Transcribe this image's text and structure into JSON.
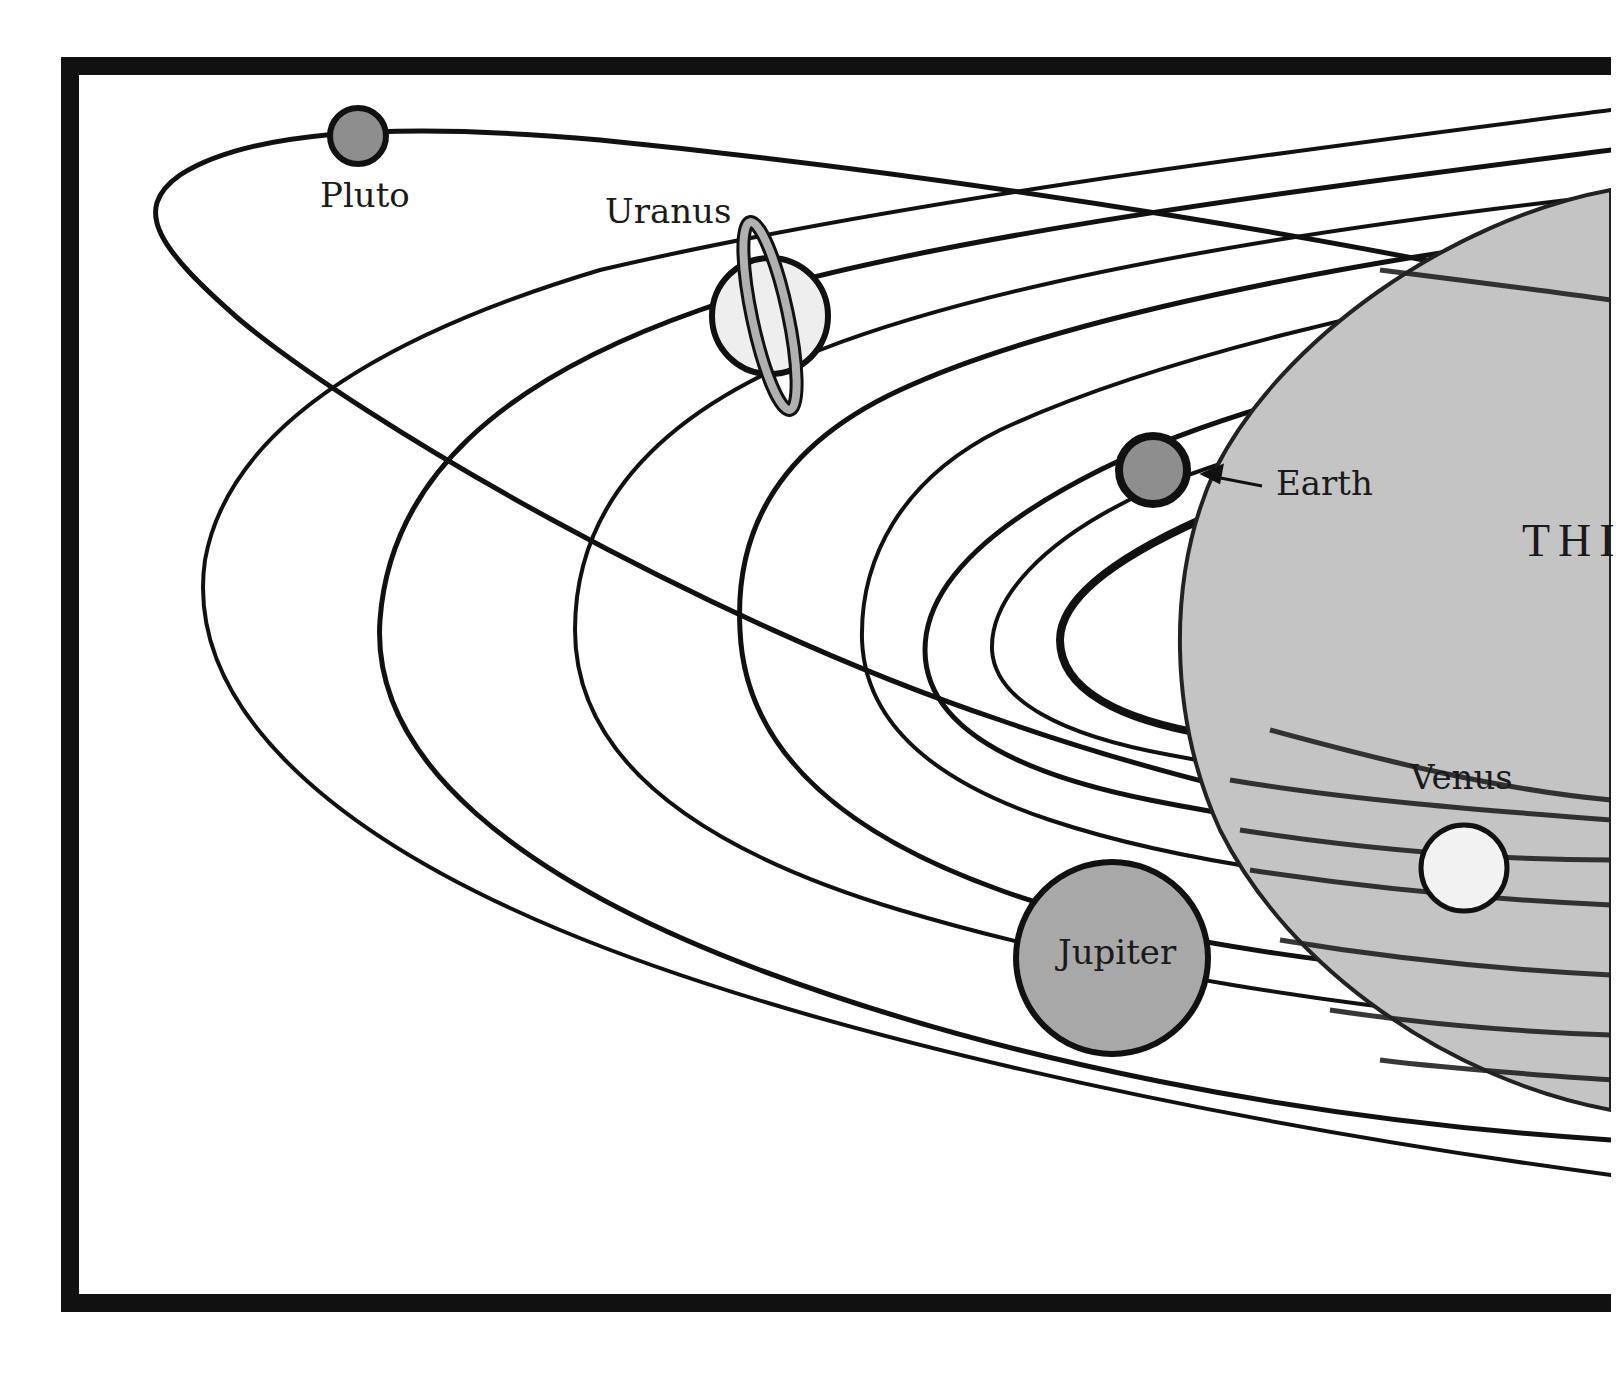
{
  "diagram": {
    "title_fragment": "THI",
    "colors": {
      "ink": "#111111",
      "sun_fill": "#c4c4c4",
      "planet_dark": "#8e8e8e",
      "planet_medium": "#a8a8a8",
      "planet_light": "#eeeeee",
      "ring": "#b0b0b0",
      "background": "#ffffff"
    },
    "sun": {
      "label": "",
      "partially_visible": true
    },
    "planets": [
      {
        "name": "Pluto",
        "label": "Pluto"
      },
      {
        "name": "Uranus",
        "label": "Uranus"
      },
      {
        "name": "Earth",
        "label": "Earth"
      },
      {
        "name": "Venus",
        "label": "Venus"
      },
      {
        "name": "Jupiter",
        "label": "Jupiter"
      }
    ],
    "annotations": {
      "earth_arrow": "arrow pointing from label to Earth"
    }
  }
}
